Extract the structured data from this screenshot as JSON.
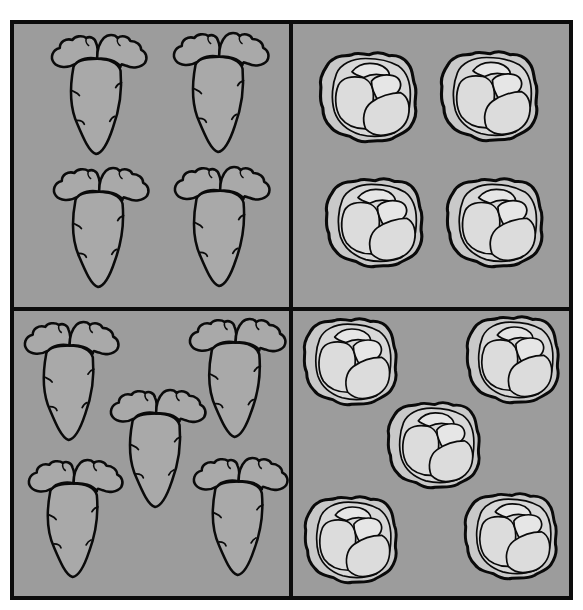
{
  "colors": {
    "background": "#9c9c9c",
    "frame": "#0c0c0c",
    "carrot_fill": "#a9a9a9",
    "cabbage_outer": "#c9c9c9",
    "cabbage_mid": "#d8d8d8",
    "cabbage_light": "#e6e6e6",
    "outline": "#0a0a0a"
  },
  "quadrants": [
    {
      "name": "top-left",
      "vegetable": "carrot",
      "count": 4,
      "items": [
        {
          "x": 50,
          "y": 33,
          "w": 98,
          "h": 124
        },
        {
          "x": 172,
          "y": 31,
          "w": 98,
          "h": 124
        },
        {
          "x": 52,
          "y": 166,
          "w": 98,
          "h": 124
        },
        {
          "x": 173,
          "y": 165,
          "w": 98,
          "h": 124
        }
      ]
    },
    {
      "name": "top-right",
      "vegetable": "cabbage",
      "count": 4,
      "items": [
        {
          "x": 317,
          "y": 49,
          "w": 105,
          "h": 95
        },
        {
          "x": 438,
          "y": 48,
          "w": 105,
          "h": 95
        },
        {
          "x": 323,
          "y": 175,
          "w": 105,
          "h": 94
        },
        {
          "x": 444,
          "y": 175,
          "w": 104,
          "h": 94
        }
      ]
    },
    {
      "name": "bottom-left",
      "vegetable": "carrot",
      "count": 5,
      "items": [
        {
          "x": 23,
          "y": 320,
          "w": 97,
          "h": 123
        },
        {
          "x": 188,
          "y": 317,
          "w": 99,
          "h": 123
        },
        {
          "x": 109,
          "y": 388,
          "w": 98,
          "h": 122
        },
        {
          "x": 27,
          "y": 458,
          "w": 97,
          "h": 122
        },
        {
          "x": 192,
          "y": 456,
          "w": 97,
          "h": 122
        }
      ]
    },
    {
      "name": "bottom-right",
      "vegetable": "cabbage",
      "count": 5,
      "items": [
        {
          "x": 301,
          "y": 315,
          "w": 101,
          "h": 92
        },
        {
          "x": 464,
          "y": 313,
          "w": 100,
          "h": 92
        },
        {
          "x": 385,
          "y": 399,
          "w": 100,
          "h": 91
        },
        {
          "x": 302,
          "y": 493,
          "w": 100,
          "h": 92
        },
        {
          "x": 462,
          "y": 490,
          "w": 100,
          "h": 91
        }
      ]
    }
  ],
  "frame": {
    "outer": {
      "x": 10,
      "y": 20,
      "w": 563,
      "h": 580,
      "thickness": 4
    },
    "vertical_divider_x": 290,
    "horizontal_divider_y": 307,
    "divider_thickness": 4
  }
}
